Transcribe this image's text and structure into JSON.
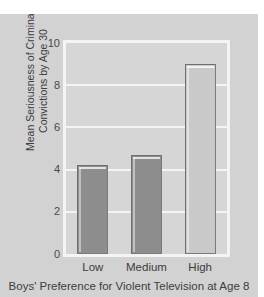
{
  "chart_data": {
    "type": "bar",
    "title": "",
    "subtitle": "",
    "xlabel": "Boys' Preference for Violent Television at Age 8",
    "ylabel": "Mean Seriousness of Criminal Convictions by Age 30",
    "ylabel_line1": "Mean Seriousness of Criminal",
    "ylabel_line2": "Convictions by Age 30",
    "categories": [
      "Low",
      "Medium",
      "High"
    ],
    "values": [
      4.2,
      4.7,
      9.0
    ],
    "ylim": [
      0,
      10
    ],
    "xlim_categories": 3,
    "yticks": [
      0,
      2,
      4,
      6,
      8,
      10
    ],
    "ytick_labels": [
      "0",
      "2",
      "4",
      "6",
      "8",
      "10"
    ],
    "gridlines_y": [
      2,
      4,
      6,
      8
    ],
    "grid": true,
    "grid_color": "#f4f4f4",
    "grid_orientation": "horizontal",
    "legend": false,
    "legend_position": "none",
    "bar_colors": [
      "#8d8d8d",
      "#8d8d8d",
      "#c9c9c9"
    ],
    "bar_edge_color": "#7a7a7a",
    "plot_background": "#d6d6d6",
    "figure_background": "#d2d2d2",
    "axis_frame_color": "#f4f4f4",
    "text_color": "#3d3d3d"
  }
}
